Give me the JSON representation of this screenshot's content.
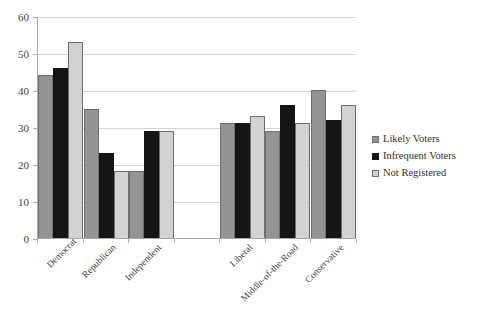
{
  "chart_data": {
    "type": "bar",
    "title": "",
    "subtitle": "",
    "xlabel": "",
    "ylabel": "",
    "ylim": [
      0,
      60
    ],
    "ytick_labels": [
      "0",
      "10",
      "20",
      "30",
      "40",
      "50",
      "60"
    ],
    "ytick_values": [
      0,
      10,
      20,
      30,
      40,
      50,
      60
    ],
    "grid": true,
    "legend_position": "right",
    "categories": [
      "Democrat",
      "Republican",
      "Independent",
      "",
      "Liberal",
      "Middle-of-the-Road",
      "Conservative"
    ],
    "series": [
      {
        "name": "Likely Voters",
        "color": "#949494",
        "values": [
          44,
          35,
          18,
          null,
          31,
          29,
          40
        ]
      },
      {
        "name": "Infrequent Voters",
        "color": "#151515",
        "values": [
          46,
          23,
          29,
          null,
          31,
          36,
          32
        ]
      },
      {
        "name": "Not Registered",
        "color": "#d2d2d2",
        "values": [
          53,
          18,
          29,
          null,
          33,
          31,
          36
        ]
      }
    ]
  },
  "legend": {
    "items": [
      {
        "label": "Likely Voters",
        "swatch": "legend-swatch-likely-voters"
      },
      {
        "label": "Infrequent Voters",
        "swatch": "legend-swatch-infrequent-voters"
      },
      {
        "label": "Not Registered",
        "swatch": "legend-swatch-not-registered"
      }
    ]
  }
}
